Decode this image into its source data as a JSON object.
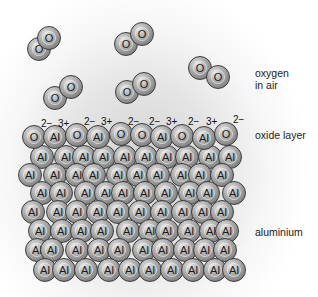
{
  "labels": {
    "oxygen_line1": "oxygen",
    "oxygen_line2": "in air",
    "oxide_layer": "oxide layer",
    "aluminium": "aluminium"
  },
  "atom_radius": 12,
  "oxygen_molecules": [
    [
      [
        39,
        49
      ],
      [
        49,
        38
      ]
    ],
    [
      [
        126,
        44
      ],
      [
        142,
        34
      ]
    ],
    [
      [
        55,
        98
      ],
      [
        71,
        87
      ]
    ],
    [
      [
        127,
        92
      ],
      [
        144,
        84
      ]
    ],
    [
      [
        200,
        68
      ],
      [
        218,
        77
      ]
    ]
  ],
  "oxide_row": [
    {
      "el": "O",
      "x": 34,
      "y": 137
    },
    {
      "el": "Al",
      "x": 55,
      "y": 137
    },
    {
      "el": "O",
      "x": 77,
      "y": 135
    },
    {
      "el": "Al",
      "x": 98,
      "y": 137
    },
    {
      "el": "O",
      "x": 121,
      "y": 134
    },
    {
      "el": "O",
      "x": 142,
      "y": 135
    },
    {
      "el": "Al",
      "x": 162,
      "y": 137
    },
    {
      "el": "O",
      "x": 182,
      "y": 136
    },
    {
      "el": "Al",
      "x": 204,
      "y": 138
    },
    {
      "el": "O",
      "x": 226,
      "y": 134
    }
  ],
  "charges": [
    {
      "text": "2−",
      "x": 41,
      "y": 119
    },
    {
      "text": "3+",
      "x": 58,
      "y": 119
    },
    {
      "text": "2−",
      "x": 84,
      "y": 117
    },
    {
      "text": "3+",
      "x": 101,
      "y": 117
    },
    {
      "text": "2−",
      "x": 128,
      "y": 117
    },
    {
      "text": "2−",
      "x": 149,
      "y": 117
    },
    {
      "text": "3+",
      "x": 166,
      "y": 117
    },
    {
      "text": "2−",
      "x": 188,
      "y": 117
    },
    {
      "text": "3+",
      "x": 206,
      "y": 117
    },
    {
      "text": "2−",
      "x": 233,
      "y": 115
    }
  ],
  "aluminium_rows": [
    {
      "y": 157,
      "xs": [
        42,
        66,
        84,
        104,
        125,
        146,
        167,
        187,
        210,
        230
      ]
    },
    {
      "y": 175,
      "xs": [
        30,
        55,
        77,
        94,
        118,
        138,
        158,
        182,
        200,
        222
      ]
    },
    {
      "y": 193,
      "xs": [
        42,
        61,
        86,
        106,
        123,
        145,
        166,
        190,
        208,
        234
      ]
    },
    {
      "y": 212,
      "xs": [
        33,
        58,
        77,
        98,
        118,
        140,
        162,
        183,
        203,
        222
      ]
    },
    {
      "y": 231,
      "xs": [
        40,
        62,
        82,
        102,
        128,
        150,
        167,
        189,
        211,
        227
      ]
    },
    {
      "y": 250,
      "xs": [
        37,
        52,
        77,
        99,
        119,
        144,
        163,
        185,
        205,
        225
      ]
    },
    {
      "y": 270,
      "xs": [
        45,
        64,
        86,
        109,
        130,
        150,
        172,
        193,
        215,
        234
      ]
    }
  ]
}
